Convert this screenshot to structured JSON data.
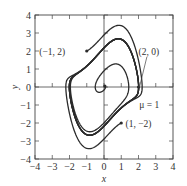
{
  "chart_data": {
    "type": "line",
    "title": "",
    "xlabel": "x",
    "ylabel": "y",
    "xlim": [
      -4,
      4
    ],
    "ylim": [
      -4,
      4
    ],
    "xticks": [
      -4,
      -3,
      -2,
      -1,
      0,
      1,
      2,
      3,
      4
    ],
    "yticks": [
      -4,
      -3,
      -2,
      -1,
      0,
      1,
      2,
      3,
      4
    ],
    "xtick_labels": [
      "−4",
      "−3",
      "−2",
      "−1",
      "0",
      "1",
      "2",
      "3",
      "4"
    ],
    "ytick_labels": [
      "−4",
      "−3",
      "−2",
      "−1",
      "0",
      "1",
      "2",
      "3",
      "4"
    ],
    "grid": false,
    "legend": null,
    "system": "Van der Pol: x' = y, y' = μ(1 − x²)y − x",
    "parameter": {
      "name": "μ",
      "value": 1
    },
    "parameter_label": "μ = 1",
    "series": [
      {
        "name": "trajectory from (−1, 2)",
        "start": [
          -1,
          2
        ],
        "label": "(−1, 2)",
        "t_end": 22
      },
      {
        "name": "trajectory from (2, 0)",
        "start": [
          2,
          0
        ],
        "label": "(2, 0)",
        "t_end": 22
      },
      {
        "name": "trajectory from (1, −2)",
        "start": [
          1,
          -2
        ],
        "label": "(1, −2)",
        "t_end": 22
      },
      {
        "name": "spiral from near origin",
        "start": [
          0.05,
          0.05
        ],
        "label": "",
        "t_end": 22
      }
    ],
    "annotations": [
      {
        "text": "(−1, 2)",
        "point": [
          -1,
          2
        ],
        "text_at": [
          -2.25,
          2.0
        ],
        "anchor": "end"
      },
      {
        "text": "(2, 0)",
        "point": [
          2,
          0
        ],
        "text_at": [
          2.6,
          2.0
        ],
        "anchor": "middle",
        "leader": true
      },
      {
        "text": "(1, −2)",
        "point": [
          1,
          -2
        ],
        "text_at": [
          1.25,
          -2.0
        ],
        "anchor": "start"
      },
      {
        "text": "μ = 1",
        "point": null,
        "text_at": [
          2.05,
          -0.95
        ],
        "anchor": "start"
      }
    ]
  },
  "colors": {
    "curve": "#2b2b2b",
    "axis": "#444444",
    "text": "#333333",
    "background": "#ffffff"
  }
}
